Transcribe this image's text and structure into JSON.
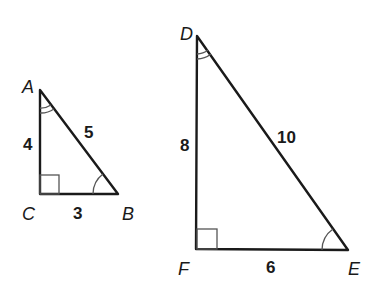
{
  "figure": {
    "colors": {
      "stroke": "#1a1a1a",
      "marks": "#555555",
      "background": "#ffffff"
    }
  },
  "triangle_abc": {
    "vertices": {
      "A": "A",
      "B": "B",
      "C": "C"
    },
    "sides": {
      "AC": "4",
      "AB": "5",
      "CB": "3"
    },
    "right_angle_at": "C",
    "double_arc_angle_at": "A",
    "single_arc_angle_at": "B"
  },
  "triangle_def": {
    "vertices": {
      "D": "D",
      "E": "E",
      "F": "F"
    },
    "sides": {
      "DF": "8",
      "DE": "10",
      "FE": "6"
    },
    "right_angle_at": "F",
    "double_arc_angle_at": "D",
    "single_arc_angle_at": "E"
  }
}
